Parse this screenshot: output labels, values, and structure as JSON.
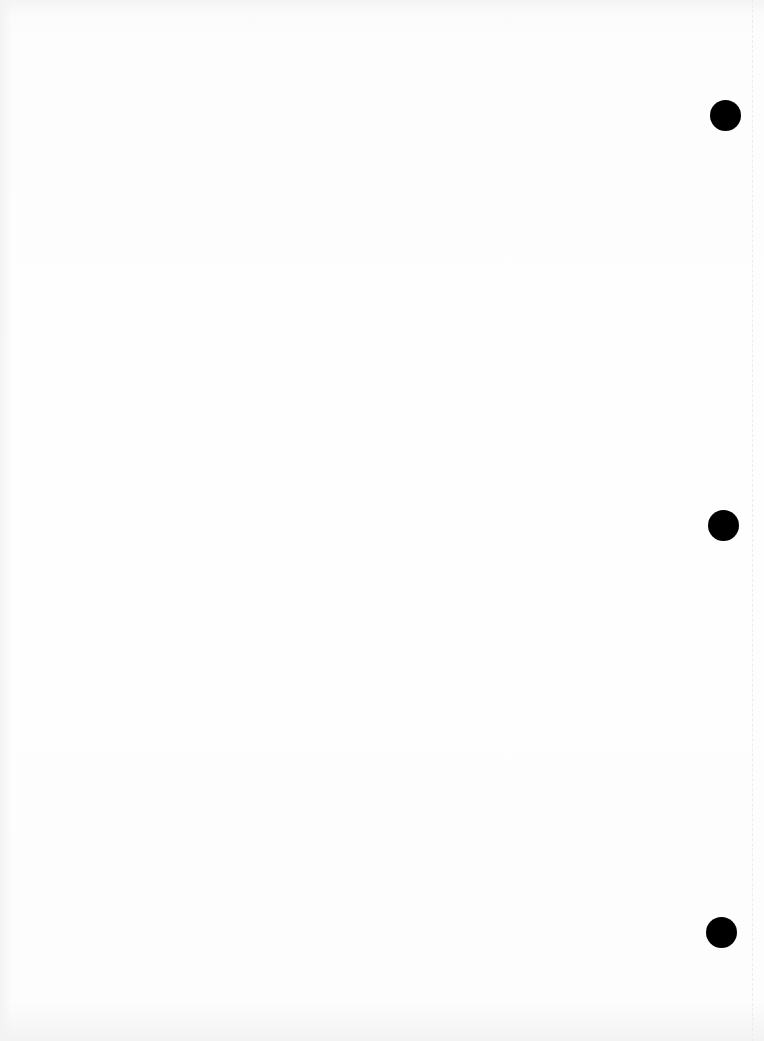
{
  "page": {
    "type": "blank-punched-sheet",
    "background_color": "#fefefe",
    "bleed_through": {
      "line1": "",
      "line2": ""
    },
    "punch_holes": [
      {
        "position": "top",
        "left": 710,
        "top": 100
      },
      {
        "position": "middle",
        "left": 708,
        "top": 510
      },
      {
        "position": "bottom",
        "left": 706,
        "top": 917
      }
    ],
    "hole_color": "#000000"
  }
}
